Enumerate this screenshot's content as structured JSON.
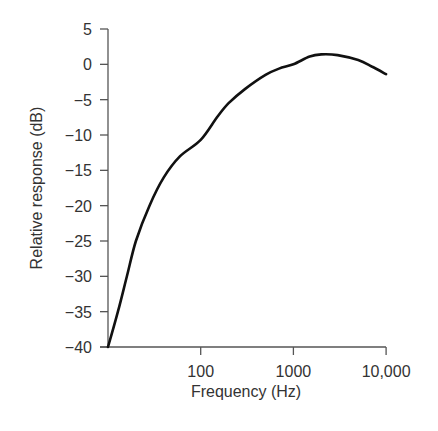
{
  "chart_data": {
    "type": "line",
    "title": "",
    "xlabel": "Frequency (Hz)",
    "ylabel": "Relative response (dB)",
    "xscale": "log",
    "xlim": [
      10,
      10000
    ],
    "ylim": [
      -40,
      5
    ],
    "grid": false,
    "legend": null,
    "x_ticks": [
      {
        "value": 100,
        "label": "100"
      },
      {
        "value": 1000,
        "label": "1000"
      },
      {
        "value": 10000,
        "label": "10,000"
      }
    ],
    "y_ticks": [
      {
        "value": 5,
        "label": "5"
      },
      {
        "value": 0,
        "label": "0"
      },
      {
        "value": -5,
        "label": "−5"
      },
      {
        "value": -10,
        "label": "−10"
      },
      {
        "value": -15,
        "label": "−15"
      },
      {
        "value": -20,
        "label": "−20"
      },
      {
        "value": -25,
        "label": "−25"
      },
      {
        "value": -30,
        "label": "−30"
      },
      {
        "value": -35,
        "label": "−35"
      },
      {
        "value": -40,
        "label": "−40"
      }
    ],
    "series": [
      {
        "name": "response",
        "color": "#111111",
        "x": [
          10,
          12.8,
          16,
          20,
          28,
          40,
          60,
          100,
          150,
          200,
          300,
          500,
          700,
          1000,
          1500,
          2000,
          3000,
          5000,
          7000,
          10000
        ],
        "y": [
          -40,
          -35,
          -30,
          -25,
          -20,
          -16,
          -13,
          -10.7,
          -7.5,
          -5.5,
          -3.5,
          -1.5,
          -0.6,
          0,
          1.1,
          1.4,
          1.3,
          0.6,
          -0.3,
          -1.4
        ]
      }
    ]
  }
}
